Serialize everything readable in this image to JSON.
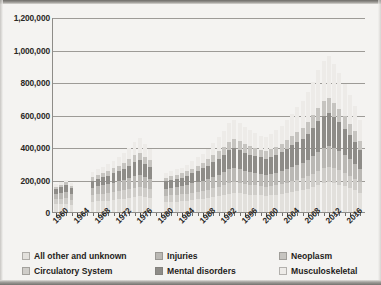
{
  "chart_data": {
    "type": "bar",
    "subtype": "stacked-bar",
    "title": "",
    "xlabel": "",
    "ylabel": "",
    "ylim": [
      0,
      1200000
    ],
    "ytick_labels": [
      "0",
      "200,000",
      "400,000",
      "600,000",
      "800,000",
      "1,000,000",
      "1,200,000"
    ],
    "ytick_values": [
      0,
      200000,
      400000,
      600000,
      800000,
      1000000,
      1200000
    ],
    "grid": true,
    "legend_position": "bottom",
    "x_start_year": 1960,
    "x_end_year": 2018,
    "xtick_labels": [
      "1960",
      "1964",
      "1968",
      "1972",
      "1976",
      "1980",
      "1984",
      "1988",
      "1992",
      "1996",
      "2000",
      "2004",
      "2008",
      "2012",
      "2016"
    ],
    "categories": [
      1960,
      1961,
      1962,
      1963,
      1964,
      1965,
      1966,
      1967,
      1968,
      1969,
      1970,
      1971,
      1972,
      1973,
      1974,
      1975,
      1976,
      1977,
      1978,
      1979,
      1980,
      1981,
      1982,
      1983,
      1984,
      1985,
      1986,
      1987,
      1988,
      1989,
      1990,
      1991,
      1992,
      1993,
      1994,
      1995,
      1996,
      1997,
      1998,
      1999,
      2000,
      2001,
      2002,
      2003,
      2004,
      2005,
      2006,
      2007,
      2008,
      2009,
      2010,
      2011,
      2012,
      2013,
      2014,
      2015,
      2016,
      2017,
      2018
    ],
    "series": [
      {
        "name": "All other and unknown",
        "color": "#e2e0dc",
        "values": [
          48000,
          50000,
          52000,
          46000,
          0,
          0,
          0,
          62000,
          66000,
          68000,
          70000,
          74000,
          78000,
          82000,
          86000,
          92000,
          96000,
          90000,
          86000,
          0,
          0,
          60000,
          62000,
          64000,
          66000,
          70000,
          74000,
          78000,
          82000,
          86000,
          92000,
          98000,
          104000,
          112000,
          116000,
          114000,
          110000,
          106000,
          104000,
          102000,
          100000,
          102000,
          106000,
          110000,
          116000,
          122000,
          128000,
          134000,
          142000,
          152000,
          164000,
          176000,
          182000,
          176000,
          168000,
          158000,
          146000,
          134000,
          120000
        ]
      },
      {
        "name": "Circulatory System",
        "color": "#cfcdc9",
        "values": [
          30000,
          32000,
          34000,
          30000,
          0,
          0,
          0,
          40000,
          42000,
          44000,
          46000,
          48000,
          50000,
          52000,
          56000,
          58000,
          60000,
          56000,
          54000,
          0,
          0,
          38000,
          40000,
          41000,
          42000,
          44000,
          46000,
          48000,
          50000,
          52000,
          56000,
          58000,
          62000,
          66000,
          68000,
          66000,
          64000,
          62000,
          60000,
          58000,
          56000,
          58000,
          60000,
          62000,
          64000,
          68000,
          70000,
          74000,
          78000,
          84000,
          90000,
          94000,
          96000,
          92000,
          88000,
          82000,
          76000,
          70000,
          62000
        ]
      },
      {
        "name": "Injuries",
        "color": "#bab8b4",
        "values": [
          34000,
          36000,
          38000,
          34000,
          0,
          0,
          0,
          46000,
          50000,
          52000,
          54000,
          58000,
          60000,
          64000,
          68000,
          72000,
          74000,
          70000,
          66000,
          0,
          0,
          44000,
          46000,
          48000,
          50000,
          52000,
          56000,
          58000,
          62000,
          66000,
          70000,
          74000,
          78000,
          84000,
          86000,
          84000,
          80000,
          78000,
          76000,
          74000,
          72000,
          74000,
          76000,
          80000,
          84000,
          88000,
          92000,
          96000,
          102000,
          110000,
          118000,
          126000,
          130000,
          124000,
          118000,
          110000,
          102000,
          94000,
          84000
        ]
      },
      {
        "name": "Mental disorders",
        "color": "#8e8c88",
        "values": [
          30000,
          34000,
          40000,
          36000,
          0,
          0,
          0,
          44000,
          48000,
          50000,
          54000,
          58000,
          62000,
          70000,
          76000,
          84000,
          90000,
          82000,
          74000,
          0,
          0,
          46000,
          48000,
          50000,
          54000,
          58000,
          62000,
          68000,
          74000,
          82000,
          90000,
          98000,
          108000,
          118000,
          122000,
          118000,
          112000,
          108000,
          104000,
          102000,
          100000,
          104000,
          110000,
          116000,
          124000,
          132000,
          140000,
          148000,
          158000,
          172000,
          186000,
          196000,
          200000,
          190000,
          178000,
          164000,
          150000,
          136000,
          118000
        ]
      },
      {
        "name": "Neoplasm",
        "color": "#c6c4c0",
        "values": [
          14000,
          16000,
          18000,
          16000,
          0,
          0,
          0,
          22000,
          24000,
          26000,
          28000,
          30000,
          32000,
          36000,
          40000,
          44000,
          46000,
          42000,
          38000,
          0,
          0,
          22000,
          24000,
          25000,
          26000,
          28000,
          30000,
          32000,
          34000,
          38000,
          42000,
          46000,
          50000,
          54000,
          56000,
          54000,
          52000,
          50000,
          48000,
          46000,
          46000,
          48000,
          50000,
          52000,
          56000,
          60000,
          64000,
          68000,
          72000,
          78000,
          84000,
          90000,
          92000,
          88000,
          82000,
          76000,
          70000,
          64000,
          56000
        ]
      },
      {
        "name": "Musculoskeletal",
        "color": "#edebe8",
        "values": [
          14000,
          16000,
          18000,
          16000,
          0,
          0,
          0,
          30000,
          34000,
          38000,
          42000,
          48000,
          54000,
          62000,
          70000,
          82000,
          90000,
          80000,
          70000,
          0,
          0,
          30000,
          32000,
          34000,
          36000,
          40000,
          46000,
          52000,
          58000,
          66000,
          76000,
          86000,
          98000,
          112000,
          118000,
          112000,
          104000,
          98000,
          92000,
          88000,
          86000,
          92000,
          100000,
          110000,
          122000,
          136000,
          150000,
          166000,
          184000,
          206000,
          230000,
          250000,
          258000,
          240000,
          220000,
          198000,
          176000,
          152000,
          126000
        ]
      }
    ]
  },
  "legend": {
    "items": [
      {
        "label": "All other and unknown"
      },
      {
        "label": "Injuries"
      },
      {
        "label": "Neoplasm"
      },
      {
        "label": "Circulatory System"
      },
      {
        "label": "Mental disorders"
      },
      {
        "label": "Musculoskeletal"
      }
    ]
  }
}
